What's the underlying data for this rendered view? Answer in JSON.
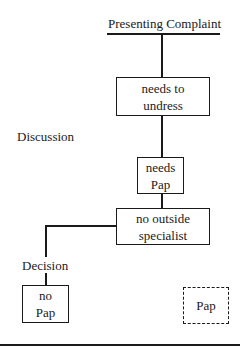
{
  "diagram": {
    "header": "Presenting Complaint",
    "stage_labels": {
      "discussion": "Discussion",
      "decision": "Decision"
    },
    "nodes": [
      {
        "id": "needs-to-undress",
        "label": "needs to\nundress",
        "style": "solid"
      },
      {
        "id": "needs-pap",
        "label": "needs\nPap",
        "style": "solid"
      },
      {
        "id": "no-outside-specialist",
        "label": "no outside\nspecialist",
        "style": "solid"
      },
      {
        "id": "no-pap",
        "label": "no\nPap",
        "style": "solid"
      },
      {
        "id": "pap",
        "label": "Pap",
        "style": "dashed"
      }
    ],
    "edges": [
      {
        "from": "header",
        "to": "needs-to-undress"
      },
      {
        "from": "needs-to-undress",
        "to": "needs-pap"
      },
      {
        "from": "needs-pap",
        "to": "no-outside-specialist"
      },
      {
        "from": "no-outside-specialist",
        "to": "no-pap",
        "via": "Decision"
      }
    ]
  }
}
